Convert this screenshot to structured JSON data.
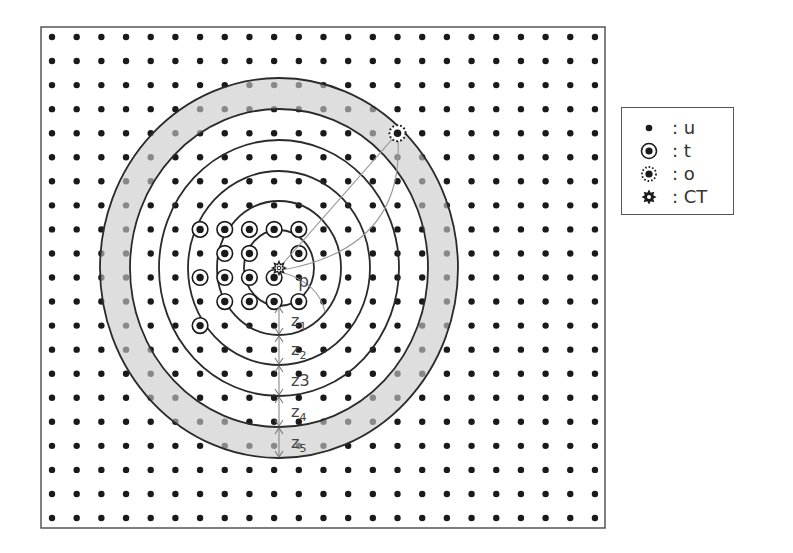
{
  "diagram": {
    "frame": {
      "x": 41,
      "y": 27,
      "width": 564,
      "height": 501
    },
    "grid": {
      "x0": 52,
      "y0": 37,
      "dx": 24.68,
      "dy": 24.05,
      "cols": 23,
      "rows": 21,
      "dot_color": "#1a1a1a"
    },
    "center": {
      "x": 279,
      "y": 268
    },
    "circles_rx": [
      35,
      62,
      91,
      120,
      149,
      179
    ],
    "circles_ry": [
      38,
      67,
      97,
      128,
      159,
      190
    ],
    "band": {
      "inner_index": 4,
      "outer_index": 5,
      "color": "#d8d8d8"
    },
    "t_nodes": [
      [
        6,
        8
      ],
      [
        7,
        8
      ],
      [
        8,
        8
      ],
      [
        9,
        8
      ],
      [
        10,
        8
      ],
      [
        7,
        9
      ],
      [
        8,
        9
      ],
      [
        10,
        9
      ],
      [
        6,
        10
      ],
      [
        7,
        10
      ],
      [
        8,
        10
      ],
      [
        9,
        10
      ],
      [
        7,
        11
      ],
      [
        8,
        11
      ],
      [
        9,
        11
      ],
      [
        10,
        11
      ],
      [
        6,
        12
      ]
    ],
    "o_node": [
      14,
      4
    ],
    "distance_label": "d",
    "z_labels": [
      {
        "text": "z1",
        "main": "z",
        "sub": "1"
      },
      {
        "text": "z2",
        "main": "z",
        "sub": "2"
      },
      {
        "text": "z3",
        "main": "z3",
        "sub": ""
      },
      {
        "text": "z4",
        "main": "z",
        "sub": "4"
      },
      {
        "text": "z5",
        "main": "z",
        "sub": "5"
      }
    ]
  },
  "legend": {
    "items": [
      {
        "icon": "dot-icon",
        "label": ": u"
      },
      {
        "icon": "ringed-dot-icon",
        "label": ": t"
      },
      {
        "icon": "dotted-ring-dot-icon",
        "label": ": o"
      },
      {
        "icon": "gear-star-icon",
        "label": ": CT"
      }
    ]
  }
}
